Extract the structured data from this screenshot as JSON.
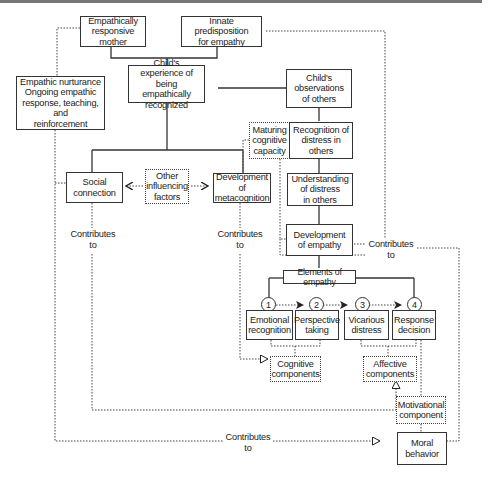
{
  "nodes": {
    "mother": "Empathically\nresponsive mother",
    "innate": "Innate predisposition\nfor empathy",
    "nurturance": "Empathic nurturance\nOngoing empathic\nresponse, teaching, and\nreinforcement",
    "experience": "Child's experience of\nbeing empathically\nrecognized",
    "observations": "Child's\nobservations\nof others",
    "maturing": "Maturing\ncognitive\ncapacity",
    "recognition_distress": "Recognition of\ndistress in\nothers",
    "social": "Social\nconnection",
    "other_factors": "Other\ninfluencing\nfactors",
    "metacognition": "Development of\nmetacognition",
    "understanding": "Understanding\nof distress\nin others",
    "dev_empathy": "Development\nof empathy",
    "elements": "Elements of empathy",
    "emotional": "Emotional\nrecognition",
    "perspective": "Perspective\ntaking",
    "vicarious": "Vicarious\ndistress",
    "response": "Response\ndecision",
    "cognitive": "Cognitive\ncomponents",
    "affective": "Affective\ncomponents",
    "motivational": "Motivational\ncomponent",
    "moral": "Moral\nbehavior"
  },
  "steps": [
    "1",
    "2",
    "3",
    "4"
  ],
  "edge_labels": {
    "social_contrib": "Contributes\nto",
    "meta_contrib": "Contributes\nto",
    "empathy_contrib": "Contributes\nto",
    "bottom_contrib": "Contributes\nto"
  },
  "colors": {
    "line": "#333333",
    "background": "#ffffff",
    "topbar": "#777777"
  }
}
